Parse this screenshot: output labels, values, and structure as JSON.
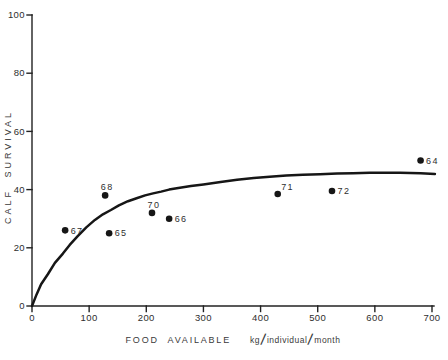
{
  "figure": {
    "background_color": "#ffffff",
    "ink_color": "#1f1f1f"
  },
  "chart_data": {
    "type": "scatter",
    "title": "",
    "xlabel": "FOOD AVAILABLE",
    "xlabel_unit": "kg/individual/month",
    "ylabel": "CALF SURVIVAL",
    "xlim": [
      0,
      700
    ],
    "ylim": [
      0,
      100
    ],
    "x_ticks": [
      0,
      100,
      200,
      300,
      400,
      500,
      600,
      700
    ],
    "y_ticks": [
      0,
      20,
      40,
      60,
      80,
      100
    ],
    "grid": false,
    "legend": null,
    "points": [
      {
        "label": "64",
        "x": 680,
        "y": 50,
        "label_pos": "right"
      },
      {
        "label": "65",
        "x": 135,
        "y": 25,
        "label_pos": "right"
      },
      {
        "label": "66",
        "x": 240,
        "y": 30,
        "label_pos": "right"
      },
      {
        "label": "67",
        "x": 58,
        "y": 26,
        "label_pos": "right"
      },
      {
        "label": "68",
        "x": 128,
        "y": 38,
        "label_pos": "above"
      },
      {
        "label": "70",
        "x": 210,
        "y": 32,
        "label_pos": "above"
      },
      {
        "label": "71",
        "x": 430,
        "y": 38.5,
        "label_pos": "above-right"
      },
      {
        "label": "72",
        "x": 525,
        "y": 39.5,
        "label_pos": "right"
      }
    ],
    "curve": {
      "description": "fitted asymptotic saturation curve",
      "points": [
        [
          0,
          0
        ],
        [
          8,
          4
        ],
        [
          16,
          7.5
        ],
        [
          28,
          11
        ],
        [
          40,
          14.8
        ],
        [
          54,
          18
        ],
        [
          66,
          21
        ],
        [
          80,
          24
        ],
        [
          95,
          27
        ],
        [
          110,
          29.6
        ],
        [
          124,
          31.5
        ],
        [
          138,
          33
        ],
        [
          152,
          34.6
        ],
        [
          168,
          36
        ],
        [
          183,
          37
        ],
        [
          198,
          38
        ],
        [
          212,
          38.7
        ],
        [
          226,
          39.3
        ],
        [
          240,
          40
        ],
        [
          256,
          40.6
        ],
        [
          278,
          41.2
        ],
        [
          300,
          41.8
        ],
        [
          330,
          42.6
        ],
        [
          359,
          43.4
        ],
        [
          388,
          44
        ],
        [
          416,
          44.4
        ],
        [
          445,
          44.8
        ],
        [
          474,
          45.1
        ],
        [
          504,
          45.3
        ],
        [
          534,
          45.5
        ],
        [
          562,
          45.6
        ],
        [
          591,
          45.8
        ],
        [
          618,
          45.8
        ],
        [
          644,
          45.8
        ],
        [
          680,
          45.6
        ],
        [
          705,
          45.4
        ]
      ]
    }
  }
}
